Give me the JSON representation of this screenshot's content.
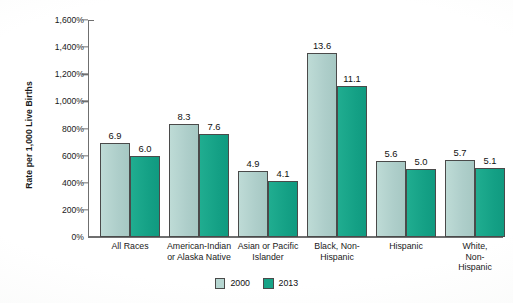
{
  "chart_data": {
    "type": "bar",
    "title": "",
    "xlabel": "",
    "ylabel": "Rate per 1,000 Live Births",
    "categories": [
      "All Races",
      "American-Indian\nor Alaska Native",
      "Asian or Pacific\nIslander",
      "Black, Non-\nHispanic",
      "Hispanic",
      "White, Non-\nHispanic"
    ],
    "series": [
      {
        "name": "2000",
        "color": "#b2d3ce",
        "values": [
          6.9,
          8.3,
          4.9,
          13.6,
          5.6,
          5.7
        ]
      },
      {
        "name": "2013",
        "color": "#17a387",
        "values": [
          6.0,
          7.6,
          4.1,
          11.1,
          5.0,
          5.1
        ]
      }
    ],
    "value_labels": {
      "series_2000": [
        "6.9",
        "8.3",
        "4.9",
        "13.6",
        "5.6",
        "5.7"
      ],
      "series_2013": [
        "6.0",
        "7.6",
        "4.1",
        "11.1",
        "5.0",
        "5.1"
      ]
    },
    "ylim": [
      0,
      16
    ],
    "ytick_values": [
      0,
      2,
      4,
      6,
      8,
      10,
      12,
      14,
      16
    ],
    "ytick_labels": [
      "0%",
      "200%",
      "400%",
      "600%",
      "800%",
      "1,000%",
      "1,200%",
      "1,400%",
      "1,600%"
    ],
    "grid": false,
    "legend_position": "bottom-center",
    "legend": [
      "2000",
      "2013"
    ]
  },
  "legend": {
    "items": [
      {
        "label": "2000",
        "color": "#b6d6d1"
      },
      {
        "label": "2013",
        "color": "#17a387"
      }
    ]
  },
  "axis": {
    "y_title": "Rate per 1,000 Live Births"
  }
}
